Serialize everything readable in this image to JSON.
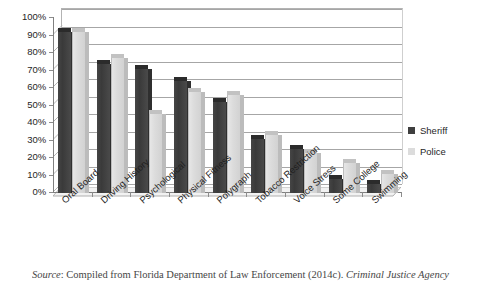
{
  "chart_data": {
    "type": "bar",
    "title": "",
    "subtitle": "",
    "xlabel": "",
    "ylabel": "",
    "ylim": [
      0,
      100
    ],
    "y_tick_labels": [
      "100%",
      "90%",
      "80%",
      "70%",
      "60%",
      "50%",
      "40%",
      "30%",
      "20%",
      "10%",
      "0%"
    ],
    "y_tick_values": [
      100,
      90,
      80,
      70,
      60,
      50,
      40,
      30,
      20,
      10,
      0
    ],
    "grid": true,
    "legend_position": "right",
    "categories": [
      "Oral Board",
      "Driving History",
      "Psychological",
      "Physical Fitness",
      "Polygraph",
      "Tobacco Restriction",
      "Voice Stress",
      "Some College",
      "Swimming"
    ],
    "series": [
      {
        "name": "Sheriff",
        "color": "#3f3f3f",
        "values": [
          92,
          74,
          71,
          64,
          52,
          31,
          25,
          8,
          5
        ]
      },
      {
        "name": "Police",
        "color": "#dcdcdc",
        "values": [
          92,
          77,
          45,
          58,
          56,
          33,
          23,
          17,
          11
        ]
      }
    ]
  },
  "legend": {
    "items": [
      {
        "label": "Sheriff",
        "swatch": "sheriff"
      },
      {
        "label": "Police",
        "swatch": "police"
      }
    ]
  },
  "caption": {
    "source_word": "Source",
    "text": ": Compiled from Florida Department of Law Enforcement (2014c).",
    "italic_tail": " Criminal Justice Agency"
  }
}
